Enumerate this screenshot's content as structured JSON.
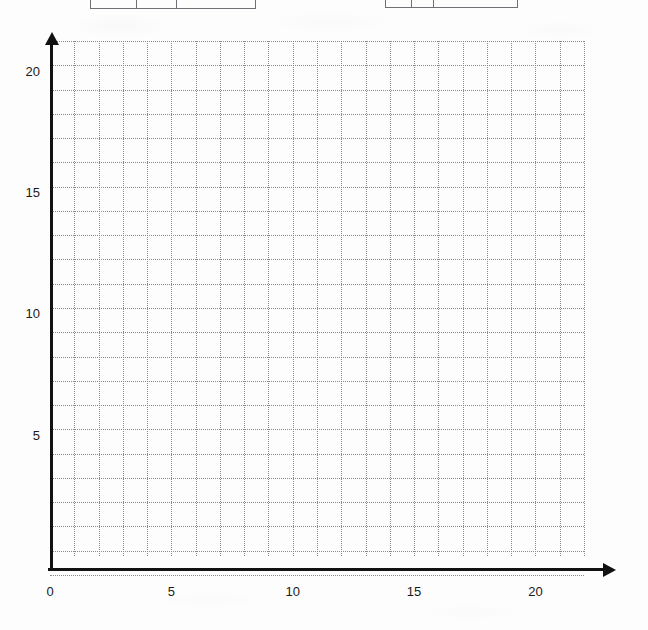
{
  "page": {
    "width": 648,
    "height": 630,
    "background_color": "#fdfdfd"
  },
  "tables": [
    {
      "name": "left-table-stub",
      "x": 90,
      "y": 0,
      "width": 166,
      "height": 9,
      "dividers": [
        45,
        85
      ],
      "note": "table cropped by top edge of image; only bottom border and column dividers visible"
    },
    {
      "name": "right-table-stub",
      "x": 385,
      "y": 0,
      "width": 133,
      "height": 8,
      "dividers": [
        25,
        47
      ],
      "note": "table cropped by top edge of image; only bottom border and column dividers visible"
    }
  ],
  "chart_data": {
    "type": "scatter",
    "title": "",
    "subtitle": "",
    "xlabel": "",
    "ylabel": "",
    "xlim": [
      0,
      22
    ],
    "ylim": [
      0,
      22
    ],
    "grid": true,
    "grid_step": 1,
    "grid_color": "#8a8a8a",
    "grid_style": "dotted",
    "axis_color": "#111111",
    "legend": null,
    "x_tick_labels": [
      "0",
      "5",
      "10",
      "15",
      "20"
    ],
    "x_tick_values": [
      0,
      5,
      10,
      15,
      20
    ],
    "y_tick_labels": [
      "5",
      "10",
      "15",
      "20"
    ],
    "y_tick_values": [
      5,
      10,
      15,
      20
    ],
    "series": [
      {
        "name": "plotted-points",
        "x": [],
        "y": []
      }
    ],
    "annotations": [],
    "note": "empty blank coordinate grid; no data plotted"
  },
  "plot_geometry": {
    "origin_x": 50,
    "origin_y": 568,
    "grid_left": 50,
    "grid_top": 41,
    "grid_right": 584,
    "grid_bottom": 556,
    "cell_px": 24.27,
    "cols": 22,
    "rows": 22,
    "y_axis_x": 50,
    "y_axis_top": 44,
    "y_axis_bottom": 570,
    "x_axis_y": 568,
    "x_axis_left": 48,
    "x_axis_right": 604
  }
}
